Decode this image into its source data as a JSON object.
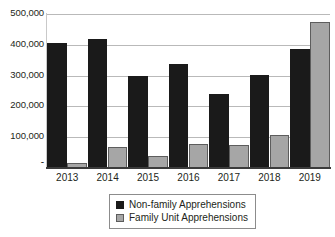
{
  "chart_data": {
    "type": "bar",
    "title": "",
    "xlabel": "",
    "ylabel": "",
    "categories": [
      "2013",
      "2014",
      "2015",
      "2016",
      "2017",
      "2018",
      "2019"
    ],
    "series": [
      {
        "name": "Non-family Apprehensions",
        "color": "#1a1a1a",
        "values": [
          405000,
          420000,
          300000,
          338000,
          240000,
          303000,
          385000
        ]
      },
      {
        "name": "Family Unit Apprehensions",
        "color": "#a6a6a6",
        "values": [
          15000,
          68000,
          40000,
          78000,
          75000,
          107000,
          473000
        ]
      }
    ],
    "ylim": [
      0,
      500000
    ],
    "ytick_labels": [
      "500,000",
      "400,000",
      "300,000",
      "200,000",
      "100,000",
      "-"
    ],
    "ytick_values": [
      500000,
      400000,
      300000,
      200000,
      100000,
      0
    ],
    "grid": true,
    "legend_position": "bottom-center"
  },
  "legend": {
    "items": [
      {
        "label": "Non-family Apprehensions",
        "swatch": "black-square-icon"
      },
      {
        "label": "Family Unit Apprehensions",
        "swatch": "gray-square-icon"
      }
    ]
  }
}
